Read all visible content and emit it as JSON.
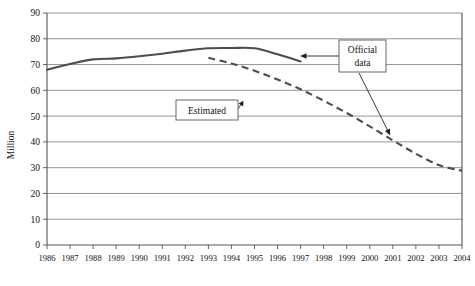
{
  "chart_data": {
    "type": "line",
    "title": "",
    "xlabel": "",
    "ylabel": "Million",
    "ylim": [
      0,
      90
    ],
    "ytick_step": 10,
    "yticks": [
      "0",
      "10",
      "20",
      "30",
      "40",
      "50",
      "60",
      "70",
      "80",
      "90"
    ],
    "grid": true,
    "legend_position": "none",
    "categories": [
      "1986",
      "1987",
      "1988",
      "1989",
      "1990",
      "1991",
      "1992",
      "1993",
      "1994",
      "1995",
      "1996",
      "1997",
      "1998",
      "1999",
      "2000",
      "2001",
      "2002",
      "2003",
      "2004"
    ],
    "series": [
      {
        "name": "Official data",
        "style": "solid",
        "x": [
          "1986",
          "1987",
          "1988",
          "1989",
          "1990",
          "1991",
          "1992",
          "1993",
          "1994",
          "1995",
          "1996",
          "1997"
        ],
        "values": [
          68.0,
          70.2,
          72.0,
          72.4,
          73.2,
          74.2,
          75.4,
          76.3,
          76.4,
          76.3,
          74.0,
          71.2
        ]
      },
      {
        "name": "Estimated",
        "style": "dashed",
        "x": [
          "1993",
          "1994",
          "1995",
          "1996",
          "1997",
          "1998",
          "1999",
          "2000",
          "2001",
          "2002",
          "2003",
          "2004"
        ],
        "values": [
          72.6,
          70.4,
          67.6,
          64.2,
          60.4,
          56.0,
          51.2,
          46.0,
          40.6,
          35.4,
          31.0,
          28.8
        ]
      }
    ],
    "annotations": [
      {
        "id": "official-data",
        "lines": [
          "Official",
          "data"
        ],
        "text": "Official data",
        "points_to": [
          "1997 solid line end",
          "2000 estimated line"
        ]
      },
      {
        "id": "estimated",
        "lines": [
          "Estimated"
        ],
        "text": "Estimated",
        "points_to": [
          "1995 dashed line"
        ]
      }
    ],
    "colors": {
      "line": "#4d4d4d",
      "grid": "#8a8a8a",
      "axis": "#555555",
      "background": "#ffffff",
      "text": "#111111"
    }
  }
}
